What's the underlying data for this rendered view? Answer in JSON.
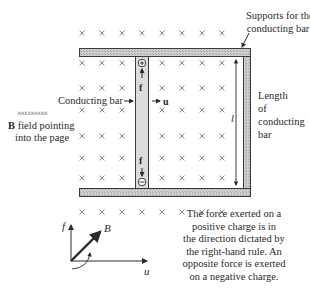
{
  "figure": {
    "labels": {
      "supports_line1": "Supports for the",
      "supports_line2": "conducting bar",
      "conducting_bar": "Conducting bar",
      "field_symbols": "×××××××××",
      "field_bold": "B",
      "field_line1_rest": " field pointing",
      "field_line2": "into the page",
      "length_line1": "Length",
      "length_line2": "of",
      "length_line3": "conducting",
      "length_line4": "bar",
      "length_symbol": "l",
      "velocity_symbol": "u",
      "force_symbol_top": "f",
      "force_symbol_bottom": "f",
      "positive_charge": "+",
      "negative_charge": "−"
    },
    "axes": {
      "f_label": "f",
      "B_label": "B",
      "u_label": "u"
    },
    "caption": {
      "line1": "The force exerted on a",
      "line2": "positive charge is in",
      "line3": "the direction dictated by",
      "line4": "the right-hand rule. An",
      "line5": "opposite force is exerted",
      "line6": "on a negative charge."
    },
    "colors": {
      "rail_fill": "#c8c8c8",
      "outline": "#3a3a3a",
      "bar_fill": "#dcdcdc",
      "cross": "#7a7a7a"
    }
  }
}
